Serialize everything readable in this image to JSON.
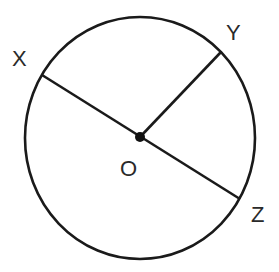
{
  "diagram": {
    "type": "circle-geometry",
    "center": {
      "label": "O",
      "x": 140,
      "y": 137
    },
    "circle": {
      "cx": 140,
      "cy": 138,
      "rx": 115,
      "ry": 121
    },
    "points": [
      {
        "label": "X",
        "x": 42,
        "y": 75,
        "label_x": 12,
        "label_y": 66
      },
      {
        "label": "Y",
        "x": 221,
        "y": 52,
        "label_x": 226,
        "label_y": 40
      },
      {
        "label": "Z",
        "x": 240,
        "y": 199,
        "label_x": 251,
        "label_y": 222
      }
    ],
    "center_label_pos": {
      "x": 120,
      "y": 176
    },
    "segments": [
      {
        "from": "X",
        "to": "Z",
        "kind": "diameter"
      },
      {
        "from": "O",
        "to": "Y",
        "kind": "radius"
      }
    ],
    "stroke_color": "#1a1a1a"
  }
}
